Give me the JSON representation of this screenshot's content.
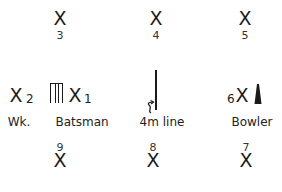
{
  "diagram": {
    "title": "",
    "fielders": [
      {
        "id": "3",
        "symbol": "X",
        "label": "3",
        "label_position": "below"
      },
      {
        "id": "4",
        "symbol": "X",
        "label": "4",
        "label_position": "below"
      },
      {
        "id": "5",
        "symbol": "X",
        "label": "5",
        "label_position": "below"
      },
      {
        "id": "2",
        "symbol": "X",
        "label": "2",
        "label_position": "right"
      },
      {
        "id": "1",
        "symbol": "X",
        "label": "1",
        "label_position": "right"
      },
      {
        "id": "6",
        "symbol": "X",
        "label": "6",
        "label_position": "left"
      },
      {
        "id": "9",
        "symbol": "X",
        "label": "9",
        "label_position": "above"
      },
      {
        "id": "8",
        "symbol": "X",
        "label": "8",
        "label_position": "above"
      },
      {
        "id": "7",
        "symbol": "X",
        "label": "7",
        "label_position": "above"
      }
    ],
    "roles": {
      "wicketkeeper": "Wk.",
      "batsman": "Batsman",
      "line": "4m line",
      "bowler": "Bowler"
    },
    "icons": {
      "stumps": "wicket-stumps-icon",
      "bowler": "bowler-marker-icon",
      "arrow": "curly-arrow-icon"
    }
  }
}
